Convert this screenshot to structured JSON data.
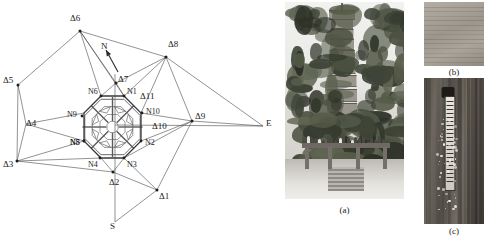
{
  "figure": {
    "panels": [
      {
        "id": "a",
        "caption": "(a)",
        "description": "pagoda-photo"
      },
      {
        "id": "b",
        "caption": "(b)",
        "description": "masonry-closeup-photo"
      },
      {
        "id": "c",
        "caption": "(c)",
        "description": "crack-gauge-photo"
      }
    ]
  },
  "chart_data": {
    "type": "diagram",
    "title": "",
    "subtitle": "",
    "xlabel": "",
    "ylabel": "",
    "grid": false,
    "legend": null,
    "view_box": "0 0 285 242",
    "compass": {
      "north_label": "N",
      "south_label": "S",
      "east_label": "E",
      "north_arrow": {
        "from": [
          118,
          72
        ],
        "to": [
          106,
          50
        ]
      },
      "axis_ns": {
        "from": [
          115,
          74
        ],
        "to": [
          115,
          222
        ]
      },
      "axis_ew": {
        "from": [
          115,
          125
        ],
        "to": [
          263,
          126
        ]
      }
    },
    "outer_stations": [
      {
        "name": "Δ6",
        "x": 80,
        "y": 31,
        "label_dx": -10,
        "label_dy": -12
      },
      {
        "name": "Δ8",
        "x": 166,
        "y": 57,
        "label_dx": 2,
        "label_dy": -12
      },
      {
        "name": "Δ9",
        "x": 192,
        "y": 121,
        "label_dx": 3,
        "label_dy": -4
      },
      {
        "name": "Δ1",
        "x": 157,
        "y": 190,
        "label_dx": 2,
        "label_dy": 7
      },
      {
        "name": "Δ2",
        "x": 113,
        "y": 172,
        "label_dx": -4,
        "label_dy": 11
      },
      {
        "name": "Δ3",
        "x": 17,
        "y": 161,
        "label_dx": -14,
        "label_dy": 4
      },
      {
        "name": "Δ5",
        "x": 18,
        "y": 85,
        "label_dx": -15,
        "label_dy": -4
      },
      {
        "name": "Δ7",
        "x": 116,
        "y": 83,
        "label_dx": 2,
        "label_dy": -3
      }
    ],
    "distance_labels": [
      {
        "name": "Δ4",
        "x": 26,
        "y": 124
      },
      {
        "name": "Δ10",
        "x": 152,
        "y": 127
      },
      {
        "name": "Δ11",
        "x": 140,
        "y": 97
      }
    ],
    "inner_nodes": [
      {
        "name": "N1",
        "x": 124,
        "y": 96,
        "label_dx": 3,
        "label_dy": -3
      },
      {
        "name": "N2",
        "x": 141,
        "y": 141,
        "label_dx": 4,
        "label_dy": 3
      },
      {
        "name": "N3",
        "x": 124,
        "y": 158,
        "label_dx": 3,
        "label_dy": 8
      },
      {
        "name": "N4",
        "x": 100,
        "y": 158,
        "label_dx": -12,
        "label_dy": 8
      },
      {
        "name": "N5",
        "x": 84,
        "y": 141,
        "label_dx": -14,
        "label_dy": 3
      },
      {
        "name": "N6",
        "x": 101,
        "y": 96,
        "label_dx": -13,
        "label_dy": -3
      },
      {
        "name": "N8",
        "x": 84,
        "y": 141,
        "label_dx": -14,
        "label_dy": 3
      },
      {
        "name": "N9",
        "x": 82,
        "y": 116,
        "label_dx": -15,
        "label_dy": 0
      },
      {
        "name": "N10",
        "x": 142,
        "y": 113,
        "label_dx": 4,
        "label_dy": 0
      }
    ],
    "octagon_vertices": [
      [
        101,
        96
      ],
      [
        124,
        96
      ],
      [
        141,
        113
      ],
      [
        141,
        141
      ],
      [
        124,
        158
      ],
      [
        101,
        158
      ],
      [
        84,
        141
      ],
      [
        84,
        113
      ]
    ],
    "network_edges": [
      [
        [
          80,
          31
        ],
        [
          166,
          57
        ]
      ],
      [
        [
          80,
          31
        ],
        [
          18,
          85
        ]
      ],
      [
        [
          80,
          31
        ],
        [
          116,
          83
        ]
      ],
      [
        [
          80,
          31
        ],
        [
          101,
          96
        ]
      ],
      [
        [
          80,
          31
        ],
        [
          124,
          96
        ]
      ],
      [
        [
          166,
          57
        ],
        [
          192,
          121
        ]
      ],
      [
        [
          166,
          57
        ],
        [
          263,
          126
        ]
      ],
      [
        [
          166,
          57
        ],
        [
          116,
          83
        ]
      ],
      [
        [
          166,
          57
        ],
        [
          124,
          96
        ]
      ],
      [
        [
          166,
          57
        ],
        [
          141,
          113
        ]
      ],
      [
        [
          192,
          121
        ],
        [
          263,
          126
        ]
      ],
      [
        [
          192,
          121
        ],
        [
          157,
          190
        ]
      ],
      [
        [
          192,
          121
        ],
        [
          141,
          113
        ]
      ],
      [
        [
          192,
          121
        ],
        [
          141,
          141
        ]
      ],
      [
        [
          192,
          121
        ],
        [
          124,
          158
        ]
      ],
      [
        [
          157,
          190
        ],
        [
          113,
          172
        ]
      ],
      [
        [
          157,
          190
        ],
        [
          115,
          222
        ]
      ],
      [
        [
          157,
          190
        ],
        [
          124,
          158
        ]
      ],
      [
        [
          113,
          172
        ],
        [
          17,
          161
        ]
      ],
      [
        [
          113,
          172
        ],
        [
          124,
          158
        ]
      ],
      [
        [
          113,
          172
        ],
        [
          101,
          158
        ]
      ],
      [
        [
          17,
          161
        ],
        [
          18,
          85
        ]
      ],
      [
        [
          17,
          161
        ],
        [
          26,
          124
        ]
      ],
      [
        [
          17,
          161
        ],
        [
          84,
          141
        ]
      ],
      [
        [
          17,
          161
        ],
        [
          101,
          158
        ]
      ],
      [
        [
          18,
          85
        ],
        [
          26,
          124
        ]
      ],
      [
        [
          26,
          124
        ],
        [
          84,
          113
        ]
      ],
      [
        [
          26,
          124
        ],
        [
          84,
          141
        ]
      ],
      [
        [
          116,
          83
        ],
        [
          101,
          96
        ]
      ],
      [
        [
          116,
          83
        ],
        [
          124,
          96
        ]
      ],
      [
        [
          141,
          113
        ],
        [
          124,
          96
        ]
      ],
      [
        [
          141,
          141
        ],
        [
          124,
          158
        ]
      ],
      [
        [
          84,
          113
        ],
        [
          101,
          96
        ]
      ],
      [
        [
          84,
          141
        ],
        [
          101,
          158
        ]
      ]
    ]
  }
}
